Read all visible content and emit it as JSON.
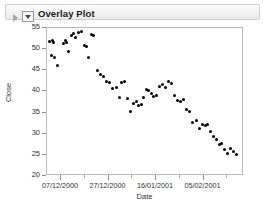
{
  "window": {
    "panel_title": "Overlay Plot",
    "outline_triangle_icon": "triangle-right-icon",
    "disclosure_icon": "disclosure-triangle-icon"
  },
  "chart_data": {
    "type": "scatter",
    "title": "Overlay Plot",
    "xlabel": "Date",
    "ylabel": "Close",
    "grid": false,
    "legend": false,
    "marker": "filled-circle",
    "marker_color": "#000000",
    "ylim": [
      20,
      55
    ],
    "yticks": [
      20,
      25,
      30,
      35,
      40,
      45,
      50,
      55
    ],
    "xticks": [
      "07/12/2000",
      "27/12/2000",
      "16/01/2001",
      "05/02/2001"
    ],
    "xtick_positions": [
      60,
      107.5,
      155,
      202.5
    ],
    "xtick_minor_positions": [
      36.5,
      83.5,
      131,
      178.5,
      226
    ],
    "xlim_labels": [
      "07/12/2000",
      "05/02/2001"
    ],
    "points": [
      {
        "x": 49.5,
        "y": 51.6
      },
      {
        "x": 52.0,
        "y": 51.8
      },
      {
        "x": 53.0,
        "y": 51.3
      },
      {
        "x": 51.5,
        "y": 48.3
      },
      {
        "x": 54.5,
        "y": 47.9
      },
      {
        "x": 57.5,
        "y": 45.9
      },
      {
        "x": 63.0,
        "y": 51.1
      },
      {
        "x": 65.0,
        "y": 51.9
      },
      {
        "x": 66.5,
        "y": 51.4
      },
      {
        "x": 68.5,
        "y": 49.2
      },
      {
        "x": 71.0,
        "y": 53.1
      },
      {
        "x": 73.0,
        "y": 53.4
      },
      {
        "x": 75.0,
        "y": 52.6
      },
      {
        "x": 78.0,
        "y": 53.6
      },
      {
        "x": 81.5,
        "y": 53.9
      },
      {
        "x": 84.0,
        "y": 50.6
      },
      {
        "x": 86.5,
        "y": 50.4
      },
      {
        "x": 88.5,
        "y": 47.9
      },
      {
        "x": 91.0,
        "y": 53.3
      },
      {
        "x": 93.5,
        "y": 52.9
      },
      {
        "x": 97.0,
        "y": 44.6
      },
      {
        "x": 100.0,
        "y": 43.8
      },
      {
        "x": 103.5,
        "y": 43.3
      },
      {
        "x": 106.5,
        "y": 42.1
      },
      {
        "x": 109.5,
        "y": 41.9
      },
      {
        "x": 112.5,
        "y": 40.4
      },
      {
        "x": 116.0,
        "y": 40.8
      },
      {
        "x": 119.0,
        "y": 38.4
      },
      {
        "x": 121.5,
        "y": 41.9
      },
      {
        "x": 124.5,
        "y": 42.2
      },
      {
        "x": 127.5,
        "y": 38.1
      },
      {
        "x": 130.5,
        "y": 35.1
      },
      {
        "x": 133.5,
        "y": 37.0
      },
      {
        "x": 136.0,
        "y": 37.3
      },
      {
        "x": 138.5,
        "y": 36.4
      },
      {
        "x": 141.0,
        "y": 36.7
      },
      {
        "x": 143.5,
        "y": 38.4
      },
      {
        "x": 146.0,
        "y": 40.2
      },
      {
        "x": 148.5,
        "y": 40.0
      },
      {
        "x": 151.0,
        "y": 39.3
      },
      {
        "x": 153.5,
        "y": 38.6
      },
      {
        "x": 156.0,
        "y": 38.9
      },
      {
        "x": 159.0,
        "y": 41.0
      },
      {
        "x": 162.0,
        "y": 41.3
      },
      {
        "x": 165.0,
        "y": 40.6
      },
      {
        "x": 168.0,
        "y": 42.0
      },
      {
        "x": 171.0,
        "y": 41.7
      },
      {
        "x": 174.0,
        "y": 38.9
      },
      {
        "x": 177.0,
        "y": 37.6
      },
      {
        "x": 180.0,
        "y": 37.3
      },
      {
        "x": 183.0,
        "y": 37.8
      },
      {
        "x": 186.0,
        "y": 35.4
      },
      {
        "x": 189.0,
        "y": 35.1
      },
      {
        "x": 192.5,
        "y": 32.4
      },
      {
        "x": 196.0,
        "y": 33.0
      },
      {
        "x": 199.0,
        "y": 30.9
      },
      {
        "x": 202.0,
        "y": 31.9
      },
      {
        "x": 205.0,
        "y": 31.6
      },
      {
        "x": 207.5,
        "y": 32.0
      },
      {
        "x": 210.0,
        "y": 30.2
      },
      {
        "x": 213.5,
        "y": 29.0
      },
      {
        "x": 216.5,
        "y": 28.5
      },
      {
        "x": 219.0,
        "y": 27.1
      },
      {
        "x": 221.5,
        "y": 27.4
      },
      {
        "x": 224.0,
        "y": 26.0
      },
      {
        "x": 227.0,
        "y": 25.2
      },
      {
        "x": 230.0,
        "y": 26.3
      },
      {
        "x": 233.0,
        "y": 25.5
      },
      {
        "x": 236.0,
        "y": 24.9
      }
    ]
  }
}
